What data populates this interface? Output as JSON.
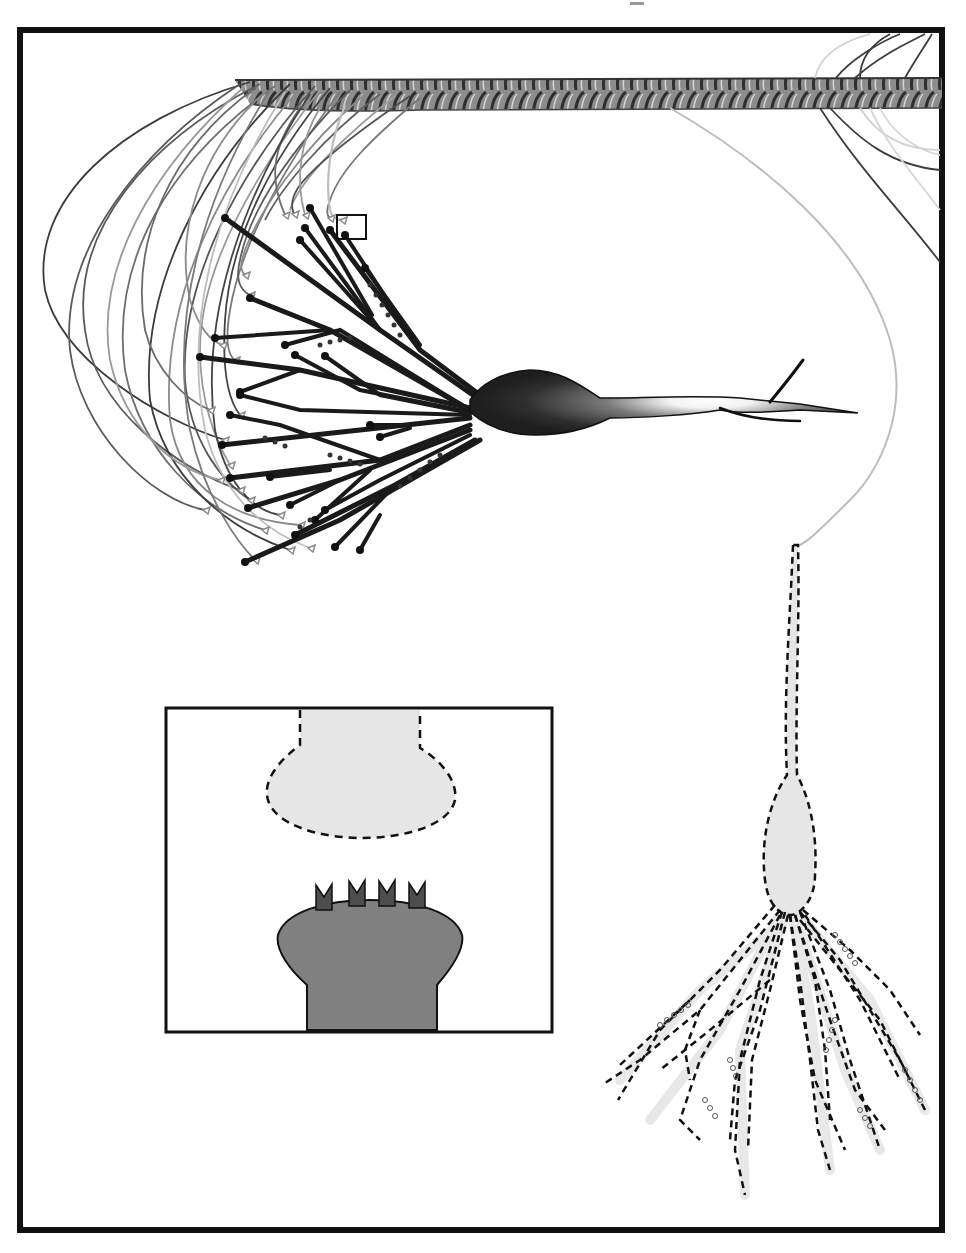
{
  "figure": {
    "title": "",
    "background": "#ffffff",
    "frame": {
      "x": 20,
      "y": 30,
      "width": 922,
      "height": 1200,
      "stroke": "#111111",
      "stroke_width": 6
    },
    "top_mark": {
      "x": 630,
      "y": 2,
      "width": 14,
      "height": 3,
      "color": "#9a9a9a"
    }
  },
  "colors": {
    "ink": "#111111",
    "dendrite": "#1a1a1a",
    "soma_dark": "#2a2a2a",
    "soma_glow": "#ffffff",
    "fiber_dark": "#3c3c3c",
    "fiber_mid": "#6e6e6e",
    "fiber_light": "#b5b5b5",
    "fiber_faint": "#d0d0d0",
    "bundle_base": "#8c8c8c",
    "ghost_fill": "#e6e6e6",
    "post_fill": "#808080",
    "receptor_fill": "#4d4d4d"
  },
  "axon_bundle": {
    "label": "axon-fiber-bundle",
    "y_top": 78,
    "y_bottom": 108,
    "x_start": 235,
    "x_end": 942
  },
  "highlight_box": {
    "x": 337,
    "y": 215,
    "width": 29,
    "height": 24
  },
  "neuron": {
    "label": "dark-neuron",
    "soma": {
      "cx": 532,
      "cy": 402,
      "rx": 62,
      "ry": 30
    },
    "axon_tips": [
      [
        858,
        413
      ],
      [
        797,
        360
      ],
      [
        800,
        421
      ]
    ]
  },
  "inset": {
    "label": "synapse-inset",
    "x": 166,
    "y": 708,
    "width": 386,
    "height": 324,
    "presynaptic": {
      "style": "dashed",
      "fill": "#e6e6e6"
    },
    "postsynaptic": {
      "style": "solid",
      "fill": "#808080"
    },
    "receptor_count": 4
  },
  "ghost_neuron": {
    "label": "dashed-neuron",
    "soma": {
      "cx": 790,
      "cy": 857,
      "rx": 27,
      "ry": 70
    },
    "fill": "#e6e6e6"
  }
}
